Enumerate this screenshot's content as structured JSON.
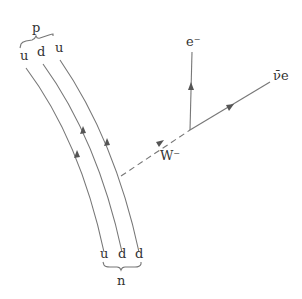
{
  "diagram": {
    "type": "feynman-diagram",
    "initial_particle": {
      "label": "n",
      "quarks": [
        "u",
        "d",
        "d"
      ]
    },
    "final_particle": {
      "label": "p",
      "quarks": [
        "u",
        "d",
        "u"
      ]
    },
    "boson": {
      "label": "W⁻"
    },
    "leptons": [
      {
        "label": "e⁻"
      },
      {
        "label": "ν̄e"
      }
    ],
    "colors": {
      "line": "#777777",
      "text": "#333333",
      "background": "#ffffff"
    }
  }
}
